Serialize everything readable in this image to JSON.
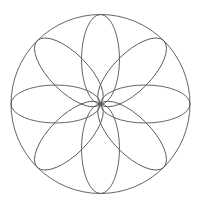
{
  "diagram": {
    "title": "",
    "stroke_color": "#555555",
    "background": "#ffffff",
    "outer_circle": {
      "cx": 100.5,
      "cy": 104,
      "r": 89.5
    },
    "petal": {
      "rx": 44.75,
      "ry": 19
    },
    "petal_angles": [
      0,
      45,
      90,
      135,
      180,
      225,
      270,
      315
    ]
  }
}
